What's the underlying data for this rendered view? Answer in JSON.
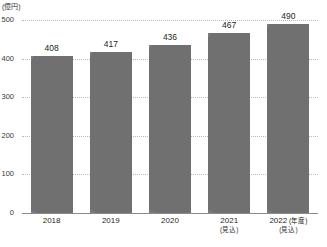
{
  "chart_data": {
    "type": "bar",
    "title": "",
    "xlabel": "",
    "ylabel": "",
    "unit_label": "(億円)",
    "axis_note": "(年度)",
    "categories": [
      "2018",
      "2019",
      "2020",
      "2021",
      "2022"
    ],
    "category_notes": [
      "",
      "",
      "",
      "(見込)",
      "(見込)"
    ],
    "values": [
      408,
      417,
      436,
      467,
      490
    ],
    "value_labels": [
      "408",
      "417",
      "436",
      "467",
      "490"
    ],
    "ylim": [
      0,
      500
    ],
    "yticks": [
      0,
      100,
      200,
      300,
      400,
      500
    ],
    "ytick_labels": [
      "0",
      "100",
      "200",
      "300",
      "400",
      "500"
    ],
    "grid": true,
    "grid_style": "dotted",
    "legend": "none",
    "bar_color": "#7a7a7a",
    "grid_color": "#b9b9b9",
    "baseline_color": "#8a8a8a",
    "background_color": "#ffffff"
  }
}
